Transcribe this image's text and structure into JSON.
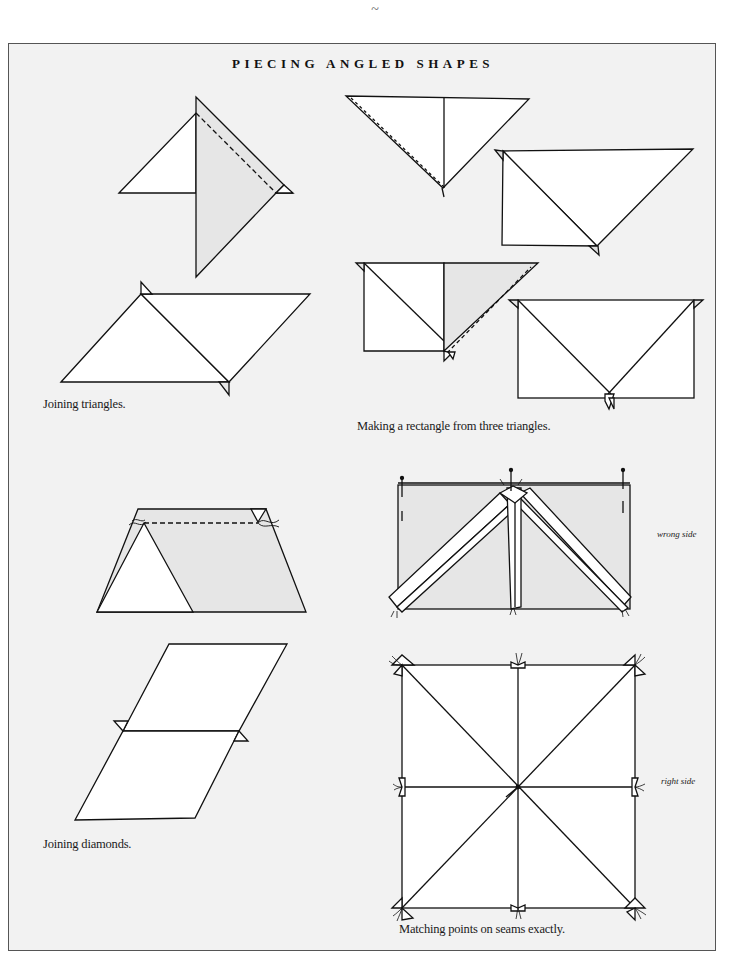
{
  "page": {
    "top_mark": "~",
    "title": "PIECING ANGLED SHAPES"
  },
  "captions": {
    "joining_triangles": "Joining triangles.",
    "rectangle_from_triangles": "Making a rectangle from three triangles.",
    "joining_diamonds": "Joining diamonds.",
    "matching_points": "Matching points on seams exactly."
  },
  "side_labels": {
    "wrong_side": "wrong side",
    "right_side": "right side"
  },
  "colors": {
    "panel_bg": "#f2f2f2",
    "fabric_white": "#ffffff",
    "fabric_shaded": "#e6e6e6",
    "line": "#111111",
    "border": "#555555"
  },
  "figures": [
    {
      "id": "joining-triangles",
      "description": "Two right triangles being joined along a diagonal seam (dashed line), then opened into a parallelogram with dog-ear points"
    },
    {
      "id": "rectangle-from-three-triangles",
      "description": "Three triangles pieced step by step into a rectangle with seam allowances showing at points"
    },
    {
      "id": "trapezoid-seam",
      "description": "Triangle and parallelogram joined with dashed stitching line and thread tails"
    },
    {
      "id": "joining-diamonds",
      "description": "Two diamonds joined along a horizontal seam with protruding dog-ears"
    },
    {
      "id": "wrong-side-pressing",
      "description": "Rectangle wrong side showing pressed seam allowances and pins"
    },
    {
      "id": "matching-points",
      "description": "Square divided by eight seams meeting at the center, right side"
    }
  ]
}
